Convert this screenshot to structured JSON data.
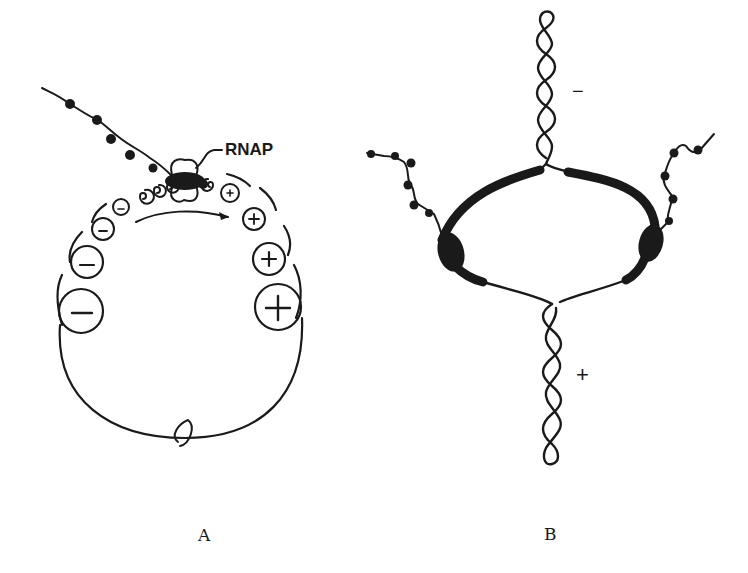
{
  "figure": {
    "panels": [
      {
        "id": "A",
        "label": "A",
        "description": "Circular DNA template with RNA polymerase transcribing; negative supercoils form behind and positive supercoils ahead",
        "annotations": {
          "polymerase_label": "RNAP",
          "negative_sign": "−",
          "positive_sign": "+"
        },
        "negative_domains": [
          "−",
          "−",
          "−",
          "−",
          "−"
        ],
        "positive_domains": [
          "+",
          "+",
          "+",
          "+",
          "+"
        ]
      },
      {
        "id": "B",
        "label": "B",
        "description": "Twin-domain model: two polymerases on a DNA loop; negative supercoils plectoneme above, positive supercoils plectoneme below",
        "annotations": {
          "top_sign": "−",
          "bottom_sign": "+"
        }
      }
    ],
    "colors": {
      "ink": "#1a1a1a",
      "background": "#ffffff"
    }
  }
}
